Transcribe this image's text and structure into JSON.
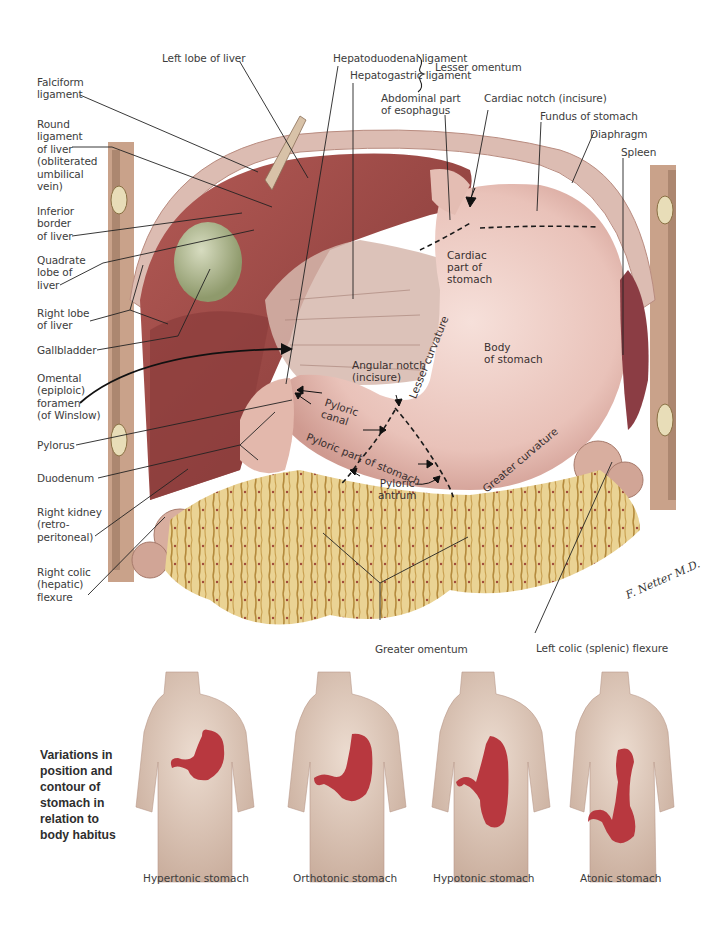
{
  "figure": {
    "type": "anatomical-illustration",
    "colors": {
      "liver": "#9e4a47",
      "liver_dark": "#7a3232",
      "stomach": "#ecc9c1",
      "stomach_shadow": "#d7a79e",
      "omentum": "#e8cf86",
      "omentum_dark": "#b7913e",
      "diaphragm": "#d8b9b0",
      "body_wall": "#c99b7f",
      "gallbladder": "#a9b28a",
      "colon": "#d9b1a3",
      "spleen": "#8b3d44",
      "body_figure": "#d9c3b5",
      "body_stomach": "#b8383f",
      "leader_line": "#222222",
      "dashed_line": "#1a1a1a"
    }
  },
  "labels_left": [
    {
      "id": "falciform",
      "text": "Falciform\nligament"
    },
    {
      "id": "round-ligament",
      "text": "Round\nligament\nof liver\n(obliterated\numbilical\nvein)"
    },
    {
      "id": "inferior-border",
      "text": "Inferior\nborder\nof liver"
    },
    {
      "id": "quadrate-lobe",
      "text": "Quadrate\nlobe of\nliver"
    },
    {
      "id": "right-lobe",
      "text": "Right lobe\nof liver"
    },
    {
      "id": "gallbladder",
      "text": "Gallbladder"
    },
    {
      "id": "omental-foramen",
      "text": "Omental\n(epiploic)\nforamen\n(of Winslow)"
    },
    {
      "id": "pylorus",
      "text": "Pylorus"
    },
    {
      "id": "duodenum",
      "text": "Duodenum"
    },
    {
      "id": "right-kidney",
      "text": "Right kidney\n(retro-\nperitoneal)"
    },
    {
      "id": "right-colic-flexure",
      "text": "Right colic\n(hepatic)\nflexure"
    }
  ],
  "labels_top": [
    {
      "id": "left-lobe",
      "text": "Left lobe of liver"
    },
    {
      "id": "hepatoduodenal",
      "text": "Hepatoduodenal ligament"
    },
    {
      "id": "hepatogastric",
      "text": "Hepatogastric ligament"
    },
    {
      "id": "lesser-omentum",
      "text": "Lesser omentum"
    },
    {
      "id": "abdominal-esophagus",
      "text": "Abdominal part\nof esophagus"
    },
    {
      "id": "cardiac-notch",
      "text": "Cardiac notch (incisure)"
    },
    {
      "id": "fundus",
      "text": "Fundus of stomach"
    },
    {
      "id": "diaphragm",
      "text": "Diaphragm"
    },
    {
      "id": "spleen",
      "text": "Spleen"
    }
  ],
  "labels_inside": [
    {
      "id": "cardiac-part",
      "text": "Cardiac\npart of\nstomach"
    },
    {
      "id": "body-of-stomach",
      "text": "Body\nof stomach"
    },
    {
      "id": "angular-notch",
      "text": "Angular notch\n(incisure)"
    },
    {
      "id": "lesser-curvature",
      "text": "Lesser curvature"
    },
    {
      "id": "greater-curvature",
      "text": "Greater curvature"
    },
    {
      "id": "pyloric-canal",
      "text": "Pyloric\ncanal"
    },
    {
      "id": "pyloric-part",
      "text": "Pyloric part of stomach"
    },
    {
      "id": "pyloric-antrum",
      "text": "Pyloric\nantrum"
    }
  ],
  "labels_bottom": [
    {
      "id": "greater-omentum",
      "text": "Greater omentum"
    },
    {
      "id": "left-colic-flexure",
      "text": "Left colic (splenic) flexure"
    }
  ],
  "signature": "F. Netter M.D.",
  "variations": {
    "title": "Variations in\nposition and\ncontour of\nstomach in\nrelation to\nbody habitus",
    "figures": [
      {
        "caption": "Hypertonic stomach"
      },
      {
        "caption": "Orthotonic stomach"
      },
      {
        "caption": "Hypotonic stomach"
      },
      {
        "caption": "Atonic stomach"
      }
    ]
  }
}
